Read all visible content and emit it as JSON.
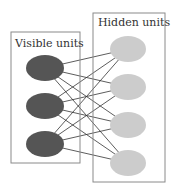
{
  "diagram": {
    "type": "restricted-boltzmann-machine",
    "visible_layer": {
      "label": "Visible units",
      "color": "#555555",
      "box": {
        "x": 11,
        "y": 32,
        "w": 69,
        "h": 131
      },
      "units": [
        {
          "cx": 45,
          "cy": 68,
          "rx": 19,
          "ry": 13
        },
        {
          "cx": 45,
          "cy": 106,
          "rx": 19,
          "ry": 13
        },
        {
          "cx": 45,
          "cy": 144,
          "rx": 19,
          "ry": 13
        }
      ]
    },
    "hidden_layer": {
      "label": "Hidden units",
      "color": "#cccccc",
      "box": {
        "x": 93,
        "y": 13,
        "w": 72,
        "h": 169
      },
      "units": [
        {
          "cx": 128,
          "cy": 49,
          "rx": 18,
          "ry": 13
        },
        {
          "cx": 128,
          "cy": 87,
          "rx": 18,
          "ry": 13
        },
        {
          "cx": 128,
          "cy": 125,
          "rx": 18,
          "ry": 13
        },
        {
          "cx": 128,
          "cy": 163,
          "rx": 18,
          "ry": 13
        }
      ]
    },
    "connections": "fully-connected (each visible unit to each hidden unit)"
  }
}
